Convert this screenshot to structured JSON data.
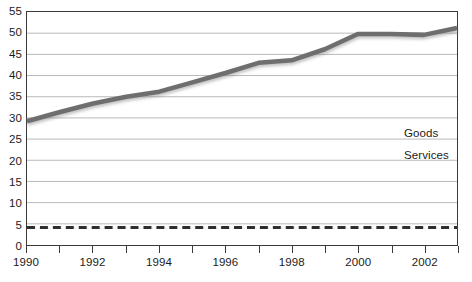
{
  "chart_data": {
    "type": "line",
    "title": "",
    "xlabel": "",
    "ylabel": "",
    "x": [
      1990,
      1991,
      1992,
      1993,
      1994,
      1995,
      1996,
      1997,
      1998,
      1999,
      2000,
      2001,
      2002,
      2003
    ],
    "xlim": [
      1990,
      2003
    ],
    "ylim": [
      0,
      55
    ],
    "ytick_labels": [
      "0",
      "5",
      "10",
      "15",
      "20",
      "25",
      "30",
      "35",
      "40",
      "45",
      "50",
      "55"
    ],
    "yticks": [
      0,
      5,
      10,
      15,
      20,
      25,
      30,
      35,
      40,
      45,
      50,
      55
    ],
    "xtick_labels": [
      "1990",
      "1992",
      "1994",
      "1996",
      "1998",
      "2000",
      "2002"
    ],
    "xticks": [
      1990,
      1992,
      1994,
      1996,
      1998,
      2000,
      2002
    ],
    "xtick_minor": [
      1990,
      1991,
      1992,
      1993,
      1994,
      1995,
      1996,
      1997,
      1998,
      1999,
      2000,
      2001,
      2002,
      2003
    ],
    "grid": true,
    "grid_axis": "y",
    "legend_position": "inside-right",
    "series": [
      {
        "name": "Goods",
        "style": "solid",
        "color": "#6e6e6e",
        "values": [
          29.2,
          31.4,
          33.4,
          35.0,
          36.2,
          38.4,
          40.6,
          43.0,
          43.6,
          46.2,
          49.8,
          49.8,
          49.6,
          51.2
        ]
      },
      {
        "name": "Services",
        "style": "dashed",
        "color": "#2e2e2e",
        "values": [
          4.0,
          4.0,
          4.0,
          4.1,
          4.1,
          4.1,
          4.2,
          4.2,
          4.2,
          4.2,
          4.2,
          4.1,
          4.1,
          4.1
        ]
      }
    ]
  },
  "legend": {
    "items": [
      {
        "label": "Goods"
      },
      {
        "label": "Services"
      }
    ]
  }
}
